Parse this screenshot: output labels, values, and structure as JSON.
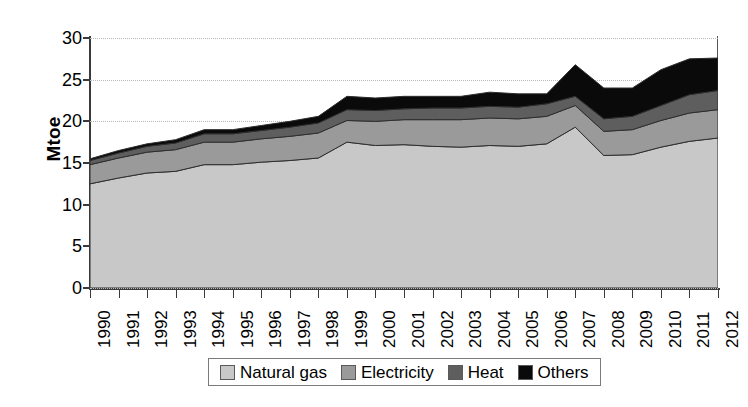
{
  "chart_data": {
    "type": "area",
    "stacked": true,
    "title": "",
    "subtitle": "",
    "xlabel": "",
    "ylabel": "Mtoe",
    "ylim": [
      0,
      30
    ],
    "ytick_step": 5,
    "yticks": [
      0,
      5,
      10,
      15,
      20,
      25,
      30
    ],
    "grid": true,
    "grid_axis": "y",
    "legend_position": "bottom-center",
    "categories": [
      "1990",
      "1991",
      "1992",
      "1993",
      "1994",
      "1995",
      "1996",
      "1997",
      "1998",
      "1999",
      "2000",
      "2001",
      "2002",
      "2003",
      "2004",
      "2005",
      "2006",
      "2007",
      "2008",
      "2009",
      "2010",
      "2011",
      "2012"
    ],
    "series": [
      {
        "name": "Natural gas",
        "color": "#c8c8c8",
        "values": [
          12.5,
          13.2,
          13.8,
          14.0,
          14.8,
          14.8,
          15.1,
          15.3,
          15.6,
          17.5,
          17.1,
          17.2,
          17.0,
          16.9,
          17.1,
          17.0,
          17.3,
          19.3,
          15.9,
          16.0,
          16.9,
          17.6,
          18.0
        ]
      },
      {
        "name": "Electricity",
        "color": "#9a9a9a",
        "values": [
          2.3,
          2.4,
          2.5,
          2.6,
          2.7,
          2.7,
          2.8,
          2.9,
          3.0,
          2.6,
          2.9,
          3.0,
          3.2,
          3.3,
          3.3,
          3.3,
          3.3,
          2.6,
          2.9,
          3.0,
          3.2,
          3.4,
          3.4
        ]
      },
      {
        "name": "Heat",
        "color": "#5e5e5e",
        "values": [
          0.5,
          0.6,
          0.7,
          0.8,
          1.0,
          1.0,
          1.0,
          1.1,
          1.2,
          1.3,
          1.3,
          1.3,
          1.4,
          1.4,
          1.4,
          1.4,
          1.5,
          1.1,
          1.5,
          1.6,
          1.8,
          2.2,
          2.3
        ]
      },
      {
        "name": "Others",
        "color": "#0a0a0a",
        "values": [
          0.2,
          0.3,
          0.3,
          0.4,
          0.5,
          0.5,
          0.6,
          0.7,
          0.8,
          1.6,
          1.5,
          1.5,
          1.4,
          1.4,
          1.7,
          1.6,
          1.2,
          3.8,
          3.7,
          3.4,
          4.3,
          4.3,
          3.9
        ]
      }
    ],
    "totals": [
      15.5,
      16.5,
      17.3,
      17.8,
      19.0,
      19.0,
      19.5,
      20.0,
      20.6,
      23.0,
      22.8,
      23.0,
      23.0,
      23.0,
      23.5,
      23.3,
      23.3,
      26.8,
      24.0,
      24.0,
      26.2,
      27.5,
      27.6
    ]
  },
  "legend": {
    "items": [
      {
        "label": "Natural gas",
        "color": "#c8c8c8"
      },
      {
        "label": "Electricity",
        "color": "#9a9a9a"
      },
      {
        "label": "Heat",
        "color": "#5e5e5e"
      },
      {
        "label": "Others",
        "color": "#0a0a0a"
      }
    ]
  }
}
